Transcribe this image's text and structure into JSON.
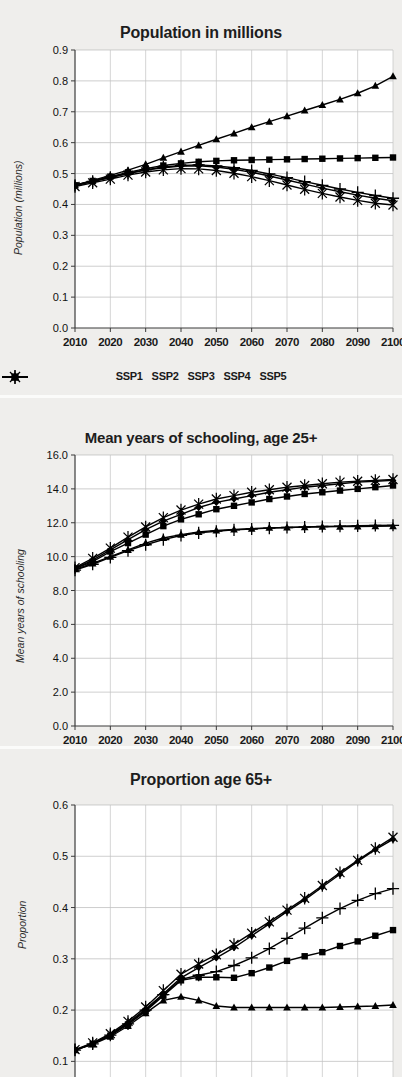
{
  "figure": {
    "background_color": "#eceae8",
    "plot_background_color": "#ffffff",
    "line_color": "#000000"
  },
  "legend": {
    "items": [
      {
        "label": "SSP1",
        "marker": "diamond"
      },
      {
        "label": "SSP2",
        "marker": "square"
      },
      {
        "label": "SSP3",
        "marker": "triangle"
      },
      {
        "label": "SSP4",
        "marker": "plus"
      },
      {
        "label": "SSP5",
        "marker": "asterisk"
      }
    ]
  },
  "chart_data": [
    {
      "id": "population",
      "type": "line",
      "title": "Population in millions",
      "xlabel": "",
      "ylabel": "Population (millions)",
      "x": [
        2010,
        2015,
        2020,
        2025,
        2030,
        2035,
        2040,
        2045,
        2050,
        2055,
        2060,
        2065,
        2070,
        2075,
        2080,
        2085,
        2090,
        2095,
        2100
      ],
      "xtick_labels": [
        "2010",
        "2020",
        "2030",
        "2040",
        "2050",
        "2060",
        "2070",
        "2080",
        "2090",
        "2100"
      ],
      "xticks": [
        2010,
        2020,
        2030,
        2040,
        2050,
        2060,
        2070,
        2080,
        2090,
        2100
      ],
      "xlim": [
        2010,
        2100
      ],
      "ylim": [
        0.0,
        0.9
      ],
      "yticks": [
        0.0,
        0.1,
        0.2,
        0.3,
        0.4,
        0.5,
        0.6,
        0.7,
        0.8,
        0.9
      ],
      "ytick_labels": [
        "0.0",
        "0.1",
        "0.2",
        "0.3",
        "0.4",
        "0.5",
        "0.6",
        "0.7",
        "0.8",
        "0.9"
      ],
      "grid": true,
      "legend_position": "below",
      "series": [
        {
          "name": "SSP1",
          "marker": "diamond",
          "values": [
            0.462,
            0.474,
            0.487,
            0.5,
            0.511,
            0.519,
            0.524,
            0.525,
            0.521,
            0.514,
            0.504,
            0.492,
            0.479,
            0.466,
            0.453,
            0.441,
            0.43,
            0.42,
            0.412
          ]
        },
        {
          "name": "SSP2",
          "marker": "square",
          "values": [
            0.462,
            0.476,
            0.49,
            0.504,
            0.516,
            0.526,
            0.533,
            0.538,
            0.541,
            0.543,
            0.544,
            0.545,
            0.546,
            0.547,
            0.548,
            0.549,
            0.55,
            0.551,
            0.552
          ]
        },
        {
          "name": "SSP3",
          "marker": "triangle",
          "values": [
            0.462,
            0.478,
            0.494,
            0.511,
            0.53,
            0.551,
            0.571,
            0.591,
            0.611,
            0.63,
            0.65,
            0.668,
            0.686,
            0.704,
            0.722,
            0.74,
            0.76,
            0.784,
            0.815
          ]
        },
        {
          "name": "SSP4",
          "marker": "plus",
          "values": [
            0.462,
            0.475,
            0.488,
            0.501,
            0.512,
            0.521,
            0.526,
            0.528,
            0.525,
            0.519,
            0.51,
            0.499,
            0.487,
            0.474,
            0.462,
            0.45,
            0.439,
            0.429,
            0.42
          ]
        },
        {
          "name": "SSP5",
          "marker": "asterisk",
          "values": [
            0.458,
            0.47,
            0.482,
            0.495,
            0.505,
            0.512,
            0.516,
            0.515,
            0.51,
            0.501,
            0.49,
            0.477,
            0.463,
            0.449,
            0.436,
            0.424,
            0.413,
            0.404,
            0.398
          ]
        }
      ]
    },
    {
      "id": "schooling",
      "type": "line",
      "title": "Mean years of schooling, age 25+",
      "xlabel": "",
      "ylabel": "Mean years of schooling",
      "x": [
        2010,
        2015,
        2020,
        2025,
        2030,
        2035,
        2040,
        2045,
        2050,
        2055,
        2060,
        2065,
        2070,
        2075,
        2080,
        2085,
        2090,
        2095,
        2100
      ],
      "xtick_labels": [
        "2010",
        "2020",
        "2030",
        "2040",
        "2050",
        "2060",
        "2070",
        "2080",
        "2090",
        "2100"
      ],
      "xticks": [
        2010,
        2020,
        2030,
        2040,
        2050,
        2060,
        2070,
        2080,
        2090,
        2100
      ],
      "xlim": [
        2010,
        2100
      ],
      "ylim": [
        0.0,
        16.0
      ],
      "yticks": [
        0.0,
        2.0,
        4.0,
        6.0,
        8.0,
        10.0,
        12.0,
        14.0,
        16.0
      ],
      "ytick_labels": [
        "0.0",
        "2.0",
        "4.0",
        "6.0",
        "8.0",
        "10.0",
        "12.0",
        "14.0",
        "16.0"
      ],
      "grid": true,
      "legend_position": "none",
      "series": [
        {
          "name": "SSP1",
          "marker": "diamond",
          "values": [
            9.3,
            9.8,
            10.4,
            11.0,
            11.6,
            12.1,
            12.5,
            12.9,
            13.2,
            13.4,
            13.6,
            13.8,
            13.95,
            14.1,
            14.2,
            14.3,
            14.4,
            14.45,
            14.5
          ]
        },
        {
          "name": "SSP2",
          "marker": "square",
          "values": [
            9.3,
            9.7,
            10.3,
            10.8,
            11.3,
            11.8,
            12.2,
            12.5,
            12.8,
            13.0,
            13.2,
            13.4,
            13.55,
            13.7,
            13.8,
            13.9,
            14.0,
            14.1,
            14.2
          ]
        },
        {
          "name": "SSP3",
          "marker": "triangle",
          "values": [
            9.25,
            9.6,
            10.0,
            10.4,
            10.8,
            11.1,
            11.3,
            11.45,
            11.55,
            11.6,
            11.65,
            11.7,
            11.72,
            11.74,
            11.76,
            11.77,
            11.78,
            11.79,
            11.8
          ]
        },
        {
          "name": "SSP4",
          "marker": "plus",
          "values": [
            9.2,
            9.55,
            9.95,
            10.35,
            10.7,
            11.0,
            11.25,
            11.4,
            11.5,
            11.58,
            11.63,
            11.68,
            11.72,
            11.75,
            11.78,
            11.8,
            11.82,
            11.84,
            11.85
          ]
        },
        {
          "name": "SSP5",
          "marker": "asterisk",
          "values": [
            9.35,
            9.9,
            10.5,
            11.15,
            11.75,
            12.3,
            12.75,
            13.1,
            13.4,
            13.6,
            13.8,
            13.95,
            14.1,
            14.2,
            14.3,
            14.4,
            14.45,
            14.5,
            14.55
          ]
        }
      ]
    },
    {
      "id": "proportion65",
      "type": "line",
      "title": "Proportion age 65+",
      "xlabel": "",
      "ylabel": "Proportion",
      "x": [
        2010,
        2015,
        2020,
        2025,
        2030,
        2035,
        2040,
        2045,
        2050,
        2055,
        2060,
        2065,
        2070,
        2075,
        2080,
        2085,
        2090,
        2095,
        2100
      ],
      "xtick_labels": [
        "2010",
        "2020",
        "2030",
        "2040",
        "2050",
        "2060",
        "2070",
        "2080",
        "2090",
        "2100"
      ],
      "xticks": [
        2010,
        2020,
        2030,
        2040,
        2050,
        2060,
        2070,
        2080,
        2090,
        2100
      ],
      "xlim": [
        2010,
        2100
      ],
      "ylim": [
        0.05,
        0.6
      ],
      "yticks": [
        0.1,
        0.2,
        0.3,
        0.4,
        0.5,
        0.6
      ],
      "ytick_labels": [
        "0.1",
        "0.2",
        "0.3",
        "0.4",
        "0.5",
        "0.6"
      ],
      "grid": true,
      "legend_position": "none",
      "series": [
        {
          "name": "SSP1",
          "marker": "diamond",
          "values": [
            0.122,
            0.135,
            0.152,
            0.175,
            0.202,
            0.232,
            0.263,
            0.283,
            0.302,
            0.322,
            0.345,
            0.368,
            0.392,
            0.415,
            0.44,
            0.465,
            0.49,
            0.513,
            0.533
          ]
        },
        {
          "name": "SSP2",
          "marker": "square",
          "values": [
            0.122,
            0.134,
            0.15,
            0.172,
            0.198,
            0.228,
            0.258,
            0.264,
            0.264,
            0.263,
            0.272,
            0.283,
            0.296,
            0.305,
            0.313,
            0.325,
            0.334,
            0.345,
            0.356
          ]
        },
        {
          "name": "SSP3",
          "marker": "triangle",
          "values": [
            0.122,
            0.133,
            0.148,
            0.169,
            0.194,
            0.219,
            0.226,
            0.219,
            0.208,
            0.205,
            0.205,
            0.205,
            0.205,
            0.205,
            0.205,
            0.206,
            0.207,
            0.208,
            0.21
          ]
        },
        {
          "name": "SSP4",
          "marker": "plus",
          "values": [
            0.122,
            0.134,
            0.151,
            0.173,
            0.2,
            0.23,
            0.26,
            0.268,
            0.275,
            0.287,
            0.302,
            0.32,
            0.34,
            0.36,
            0.38,
            0.398,
            0.414,
            0.427,
            0.437
          ]
        },
        {
          "name": "SSP5",
          "marker": "asterisk",
          "values": [
            0.123,
            0.136,
            0.154,
            0.178,
            0.206,
            0.238,
            0.27,
            0.29,
            0.308,
            0.328,
            0.35,
            0.372,
            0.395,
            0.418,
            0.443,
            0.468,
            0.492,
            0.515,
            0.537
          ]
        }
      ]
    }
  ]
}
